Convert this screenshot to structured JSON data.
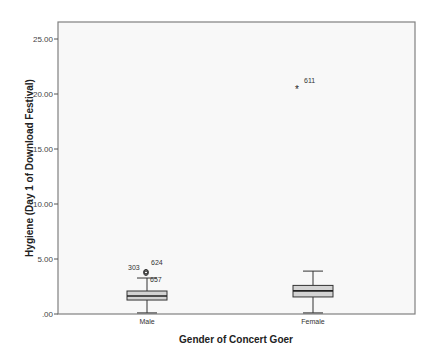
{
  "chart_data": {
    "type": "boxplot",
    "title": "",
    "xlabel": "Gender of Concert Goer",
    "ylabel": "Hygiene (Day 1 of Download Festival)",
    "ylim": [
      0,
      25
    ],
    "yticks": [
      ".00",
      "5.00",
      "10.00",
      "15.00",
      "20.00",
      "25.00"
    ],
    "ytick_values": [
      0,
      5,
      10,
      15,
      20,
      25
    ],
    "categories": [
      "Male",
      "Female"
    ],
    "series": [
      {
        "name": "Male",
        "min": 0.1,
        "q1": 1.27,
        "median": 1.64,
        "q3": 2.09,
        "max": 3.27,
        "outliers": [
          {
            "value": 3.8,
            "label": "303",
            "marker": "circle"
          },
          {
            "value": 3.85,
            "label": "624",
            "marker": "circle"
          },
          {
            "value": 3.7,
            "label": "657",
            "marker": "circle"
          }
        ]
      },
      {
        "name": "Female",
        "min": 0.1,
        "q1": 1.55,
        "median": 2.1,
        "q3": 2.6,
        "max": 3.9,
        "outliers": [
          {
            "value": 20.4,
            "label": "611",
            "marker": "star"
          }
        ]
      }
    ],
    "grid": false,
    "legend": "none"
  },
  "colors": {
    "box_fill": "#d3d3d3",
    "frame": "#808080",
    "plot_bg": "#f8f8f8"
  }
}
